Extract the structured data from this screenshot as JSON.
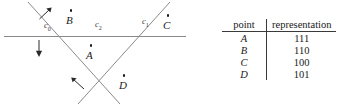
{
  "figure": {
    "curves": [
      {
        "id": "c0",
        "name": "c",
        "sub": "0"
      },
      {
        "id": "c2",
        "name": "c",
        "sub": "2"
      },
      {
        "id": "c1",
        "name": "c",
        "sub": "1"
      }
    ],
    "points": [
      {
        "id": "A",
        "label": "A"
      },
      {
        "id": "B",
        "label": "B"
      },
      {
        "id": "C",
        "label": "C"
      },
      {
        "id": "D",
        "label": "D"
      }
    ],
    "line_color": "#8a8a8a",
    "ink_color": "#1a1a1a"
  },
  "table": {
    "headers": {
      "point": "point",
      "representation": "representation"
    },
    "rows": [
      {
        "point": "A",
        "representation": "111"
      },
      {
        "point": "B",
        "representation": "110"
      },
      {
        "point": "C",
        "representation": "100"
      },
      {
        "point": "D",
        "representation": "101"
      }
    ]
  }
}
